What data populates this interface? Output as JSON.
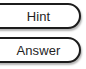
{
  "screen": {
    "width": 86,
    "height": 69,
    "background_color": "#ffffff"
  },
  "style": {
    "border_color": "#1c1c1c",
    "text_color": "#1f1f1f",
    "fill_color": "#ffffff",
    "shadow_color": "rgba(0,0,0,0.30)"
  },
  "buttons": [
    {
      "id": "hint",
      "label": "Hint",
      "shape": "rounded-pill",
      "state": "enabled"
    },
    {
      "id": "answer",
      "label": "Answer",
      "shape": "rounded-pill",
      "state": "enabled"
    }
  ]
}
